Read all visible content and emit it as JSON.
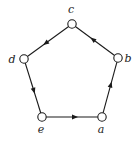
{
  "diagram": {
    "type": "directed-cycle-graph",
    "nodes": [
      {
        "id": "a",
        "label": "a",
        "x": 102,
        "y": 117,
        "lx": 101,
        "ly": 133
      },
      {
        "id": "b",
        "label": "b",
        "x": 118,
        "y": 58,
        "lx": 128,
        "ly": 62
      },
      {
        "id": "c",
        "label": "c",
        "x": 72,
        "y": 24,
        "lx": 71,
        "ly": 13
      },
      {
        "id": "d",
        "label": "d",
        "x": 24,
        "y": 59,
        "lx": 12,
        "ly": 63
      },
      {
        "id": "e",
        "label": "e",
        "x": 42,
        "y": 117,
        "lx": 41,
        "ly": 133
      }
    ],
    "edges": [
      {
        "from": "a",
        "to": "b"
      },
      {
        "from": "b",
        "to": "c"
      },
      {
        "from": "c",
        "to": "d"
      },
      {
        "from": "d",
        "to": "e"
      },
      {
        "from": "e",
        "to": "a"
      }
    ],
    "colors": {
      "stroke": "#1a1a1a",
      "node_fill": "#ffffff",
      "label": "#222222",
      "background": "#ffffff"
    }
  }
}
